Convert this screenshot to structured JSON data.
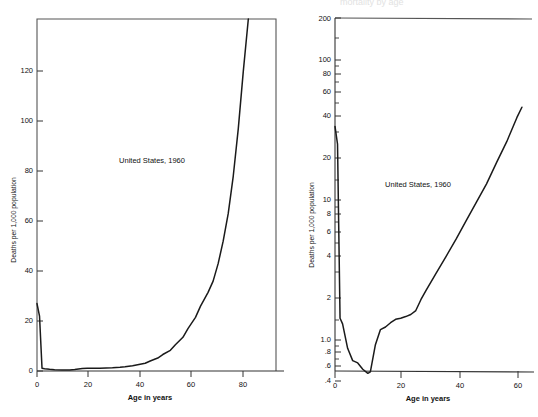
{
  "figure": {
    "background": "#ffffff",
    "ink_color": "#1a1a1a",
    "ghost_header": "mortality by age"
  },
  "chart_data": [
    {
      "type": "line",
      "id": "linear-scale-mortality",
      "title": "",
      "annotation": "United States, 1960",
      "xlabel": "Age in years",
      "ylabel": "Deaths per 1,000 population",
      "xlim": [
        0,
        95
      ],
      "ylim": [
        0,
        141
      ],
      "yscale": "linear",
      "grid": false,
      "legend": "none",
      "xticks": [
        0,
        20,
        40,
        60,
        80
      ],
      "xticklabels": [
        "0",
        "20",
        "40",
        "60",
        "80"
      ],
      "yticks": [
        0,
        20,
        40,
        60,
        80,
        100,
        120
      ],
      "yticklabels": [
        "0",
        "20",
        "40",
        "60",
        "80",
        "100",
        "120"
      ],
      "x": [
        0,
        1,
        2,
        3,
        5,
        7,
        10,
        13,
        15,
        18,
        20,
        22,
        25,
        30,
        33,
        35,
        38,
        40,
        43,
        45,
        48,
        50,
        53,
        55,
        58,
        60,
        63,
        65,
        68,
        70,
        72,
        74,
        76,
        78,
        80,
        82,
        84
      ],
      "values": [
        27.0,
        22.0,
        1.1,
        0.9,
        0.7,
        0.55,
        0.45,
        0.45,
        0.6,
        1.0,
        1.1,
        1.1,
        1.1,
        1.3,
        1.5,
        1.7,
        2.1,
        2.5,
        3.1,
        4.0,
        5.2,
        6.6,
        8.3,
        10.5,
        13.5,
        17.0,
        21.5,
        26.0,
        31.5,
        36.0,
        43.0,
        52.0,
        63.0,
        78.0,
        97.0,
        120.0,
        141.0
      ]
    },
    {
      "type": "line",
      "id": "log-scale-mortality",
      "title": "",
      "annotation": "United States, 1960",
      "xlabel": "Age in years",
      "ylabel": "Deaths per 1,000 population",
      "xlim": [
        0,
        78
      ],
      "ylim": [
        0.35,
        200
      ],
      "yscale": "log",
      "grid": false,
      "legend": "none",
      "xticks": [
        0,
        20,
        40,
        60
      ],
      "xticklabels": [
        "0",
        "20",
        "40",
        "60"
      ],
      "yticks": [
        0.4,
        0.6,
        0.8,
        1.0,
        2,
        4,
        6,
        8,
        10,
        20,
        40,
        60,
        80,
        100,
        200
      ],
      "yticklabels": [
        ".4",
        ".6",
        ".8",
        "1.0",
        "2",
        "4",
        "6",
        "8",
        "10",
        "20",
        "40",
        "60",
        "80",
        "100",
        "200"
      ],
      "yminorticks": [
        0.5,
        0.7,
        0.9,
        1.5,
        3,
        5,
        7,
        9,
        15,
        30,
        50,
        70,
        90,
        150
      ],
      "x": [
        0,
        1,
        2,
        3,
        5,
        7,
        9,
        11,
        13,
        14,
        16,
        18,
        20,
        22,
        24,
        26,
        28,
        30,
        32,
        34,
        36,
        40,
        44,
        48,
        52,
        56,
        60,
        64,
        68,
        72,
        74
      ],
      "values": [
        30.0,
        22.0,
        1.05,
        0.95,
        0.62,
        0.5,
        0.48,
        0.43,
        0.4,
        0.41,
        0.66,
        0.86,
        0.9,
        0.97,
        1.03,
        1.05,
        1.08,
        1.12,
        1.2,
        1.45,
        1.7,
        2.3,
        3.1,
        4.2,
        5.8,
        8.0,
        11.0,
        16.0,
        23.0,
        35.0,
        42.0
      ]
    }
  ]
}
